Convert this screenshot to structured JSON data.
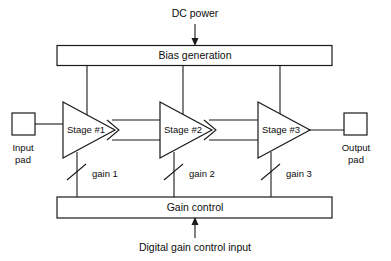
{
  "diagram": {
    "title_text": "Variable gain amplifier block diagram",
    "top_label": "DC power",
    "bias_box_label": "Bias generation",
    "gain_box_label": "Gain control",
    "bottom_label": "Digital gain control input",
    "input_pad": {
      "line1": "Input",
      "line2": "pad"
    },
    "output_pad": {
      "line1": "Output",
      "line2": "pad"
    },
    "stages": [
      {
        "label": "Stage #1",
        "gain_label": "gain 1"
      },
      {
        "label": "Stage #2",
        "gain_label": "gain 2"
      },
      {
        "label": "Stage #3",
        "gain_label": "gain 3"
      }
    ],
    "colors": {
      "background": "#ffffff",
      "stroke": "#1a1a1a",
      "text": "#0d0d0d"
    }
  }
}
